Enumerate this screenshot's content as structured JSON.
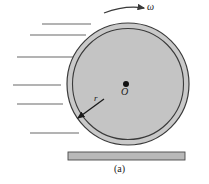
{
  "figure": {
    "caption": "(a)",
    "labels": {
      "angular_velocity": "ω",
      "center": "O",
      "radius": "r"
    },
    "colors": {
      "tire_fill": "#c9c9c9",
      "rim_fill": "#c4c4c4",
      "outline": "#3a3a3a",
      "ground_fill": "#b9b9b9",
      "flow_line": "#9a9a9a",
      "label_text": "#1a1a1a"
    },
    "geometry": {
      "wheel_center_x": 128,
      "wheel_center_y": 84,
      "outer_radius": 61,
      "inner_radius": 56,
      "ground_left": 68,
      "ground_right": 185,
      "ground_top": 152,
      "ground_bottom": 160
    },
    "flow_lines": [
      {
        "x1": 42,
        "x2": 91,
        "y": 24
      },
      {
        "x1": 30,
        "x2": 86,
        "y": 35
      },
      {
        "x1": 17,
        "x2": 81,
        "y": 57
      },
      {
        "x1": 13,
        "x2": 61,
        "y": 85
      },
      {
        "x1": 17,
        "x2": 63,
        "y": 104
      },
      {
        "x1": 30,
        "x2": 79,
        "y": 133
      }
    ],
    "omega_arrow": {
      "start_x": 104,
      "start_y": 12,
      "end_x": 145,
      "end_y": 8
    },
    "radius_arrow": {
      "start_x": 104,
      "start_y": 99,
      "end_x": 77,
      "end_y": 119
    }
  }
}
